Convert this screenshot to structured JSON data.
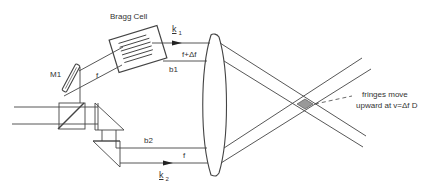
{
  "diagram": {
    "colors": {
      "line": "#444444",
      "fringe_fill": "#888888",
      "background": "#ffffff"
    },
    "labels": {
      "bragg_cell": "Bragg Cell",
      "mirror": "M1",
      "k1_main": "k",
      "k1_sub": "1",
      "k2_main": "k",
      "k2_sub": "2",
      "freq_shifted": "f+Δf",
      "freq_f_upper": "f",
      "freq_f_lower": "f",
      "beam_b1": "b1",
      "beam_b2": "b2",
      "note_line1": "fringes move",
      "note_line2": "upward at v=Δf D"
    },
    "components": [
      {
        "name": "Bragg Cell",
        "type": "acousto-optic modulator"
      },
      {
        "name": "M1",
        "type": "mirror"
      },
      {
        "name": "beam splitter",
        "type": "cube beam splitter"
      },
      {
        "name": "prisms",
        "type": "right-angle prism pair"
      },
      {
        "name": "lens",
        "type": "converging lens"
      },
      {
        "name": "probe volume",
        "type": "beam crossing / fringe region"
      }
    ]
  }
}
